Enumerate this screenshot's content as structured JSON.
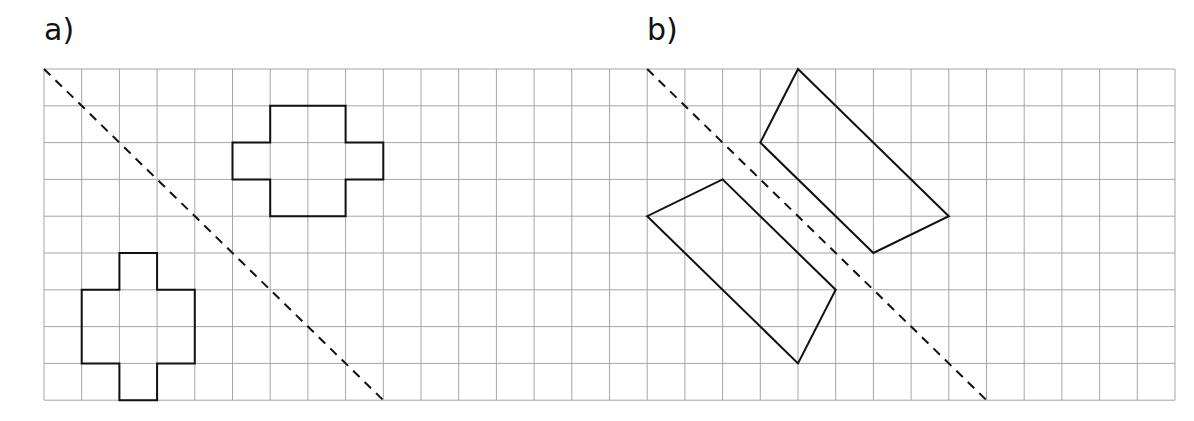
{
  "labels": {
    "part_a": "a)",
    "part_b": "b)"
  },
  "grid": {
    "origin_x": 44,
    "origin_y": 69,
    "columns": 30,
    "rows": 9,
    "cell_width": 37.7,
    "cell_height": 36.8,
    "line_color": "#a6a6a6",
    "line_width": 1
  },
  "style": {
    "shape_color": "#111111",
    "shape_width": 2,
    "mirror_color": "#111111",
    "mirror_width": 2,
    "mirror_dash": "9 7"
  },
  "parts": [
    {
      "id": "a",
      "mirror_line": [
        [
          0,
          0
        ],
        [
          9,
          9
        ]
      ],
      "shapes": [
        {
          "name": "cross-shape-upper",
          "points": [
            [
              6,
              1
            ],
            [
              8,
              1
            ],
            [
              8,
              2
            ],
            [
              9,
              2
            ],
            [
              9,
              3
            ],
            [
              8,
              3
            ],
            [
              8,
              4
            ],
            [
              6,
              4
            ],
            [
              6,
              3
            ],
            [
              5,
              3
            ],
            [
              5,
              2
            ],
            [
              6,
              2
            ]
          ]
        },
        {
          "name": "cross-shape-lower",
          "points": [
            [
              2,
              5
            ],
            [
              3,
              5
            ],
            [
              3,
              6
            ],
            [
              4,
              6
            ],
            [
              4,
              8
            ],
            [
              3,
              8
            ],
            [
              3,
              9
            ],
            [
              2,
              9
            ],
            [
              2,
              8
            ],
            [
              1,
              8
            ],
            [
              1,
              6
            ],
            [
              2,
              6
            ]
          ]
        }
      ]
    },
    {
      "id": "b",
      "mirror_line": [
        [
          16,
          0
        ],
        [
          25,
          9
        ]
      ],
      "shapes": [
        {
          "name": "quadrilateral-upper-right",
          "points": [
            [
              20,
              0
            ],
            [
              24,
              4
            ],
            [
              22,
              5
            ],
            [
              19,
              2
            ]
          ]
        },
        {
          "name": "quadrilateral-lower-left",
          "points": [
            [
              18,
              3
            ],
            [
              21,
              6
            ],
            [
              20,
              8
            ],
            [
              16,
              4
            ]
          ]
        }
      ]
    }
  ]
}
